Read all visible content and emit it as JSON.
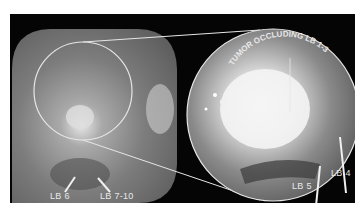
{
  "figure": {
    "panels": [
      {
        "id": "overview",
        "description": "endoscopic view, grayscale"
      },
      {
        "id": "magnified",
        "description": "circular magnified inset of tumor"
      }
    ],
    "labels": {
      "top_arc": "TUMOR OCCLUDING LB 1-3",
      "lb6": "LB 6",
      "lb7_10": "LB 7-10",
      "lb5": "LB 5",
      "lb4": "LB 4"
    },
    "colors": {
      "background": "#ffffff",
      "panel": "#050505",
      "outline": "#e6e6e6",
      "label": "#e8e8e8"
    },
    "caption": ""
  }
}
